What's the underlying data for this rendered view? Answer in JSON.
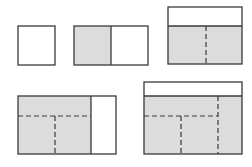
{
  "diagram": {
    "title": "",
    "colors": {
      "background": "#ffffff",
      "stroke": "#3a3a3a",
      "shaded_fill": "#dcdcdc",
      "unshaded_fill": "#ffffff"
    },
    "figures": [
      {
        "id": "fig1",
        "description": "Single unshaded square",
        "rect": [
          18,
          26,
          37,
          39
        ],
        "regions": [
          {
            "rect": [
              18,
              26,
              37,
              39
            ],
            "shaded": false
          }
        ],
        "solid_lines": [],
        "dashed_lines": []
      },
      {
        "id": "fig2",
        "description": "Two squares side by side, left shaded",
        "rect": [
          74,
          26,
          74,
          39
        ],
        "regions": [
          {
            "rect": [
              74,
              26,
              37,
              39
            ],
            "shaded": true
          },
          {
            "rect": [
              111,
              26,
              37,
              39
            ],
            "shaded": false
          }
        ],
        "solid_lines": [
          [
            111,
            26,
            111,
            65
          ]
        ],
        "dashed_lines": []
      },
      {
        "id": "fig3",
        "description": "Rectangle with unshaded top strip, shaded bottom split by dashed vertical line",
        "rect": [
          168,
          7,
          74,
          57
        ],
        "regions": [
          {
            "rect": [
              168,
              7,
              74,
              19
            ],
            "shaded": false
          },
          {
            "rect": [
              168,
              26,
              74,
              38
            ],
            "shaded": true
          }
        ],
        "solid_lines": [
          [
            168,
            26,
            242,
            26
          ]
        ],
        "dashed_lines": [
          [
            206,
            26,
            206,
            64
          ]
        ]
      },
      {
        "id": "fig4",
        "description": "Rectangle with shaded left portion subdivided by dashed lines and unshaded right strip",
        "rect": [
          18,
          96,
          98,
          58
        ],
        "regions": [
          {
            "rect": [
              18,
              96,
              73,
              58
            ],
            "shaded": true
          },
          {
            "rect": [
              91,
              96,
              25,
              58
            ],
            "shaded": false
          }
        ],
        "solid_lines": [
          [
            91,
            96,
            91,
            154
          ]
        ],
        "dashed_lines": [
          [
            18,
            116,
            91,
            116
          ],
          [
            55,
            116,
            55,
            154
          ]
        ]
      },
      {
        "id": "fig5",
        "description": "Rectangle with unshaded top strip, shaded body subdivided by dashed lines",
        "rect": [
          144,
          82,
          98,
          72
        ],
        "regions": [
          {
            "rect": [
              144,
              82,
              98,
              14
            ],
            "shaded": false
          },
          {
            "rect": [
              144,
              96,
              98,
              58
            ],
            "shaded": true
          }
        ],
        "solid_lines": [
          [
            144,
            96,
            242,
            96
          ]
        ],
        "dashed_lines": [
          [
            218,
            96,
            218,
            154
          ],
          [
            144,
            116,
            218,
            116
          ],
          [
            181,
            116,
            181,
            154
          ]
        ]
      }
    ]
  }
}
